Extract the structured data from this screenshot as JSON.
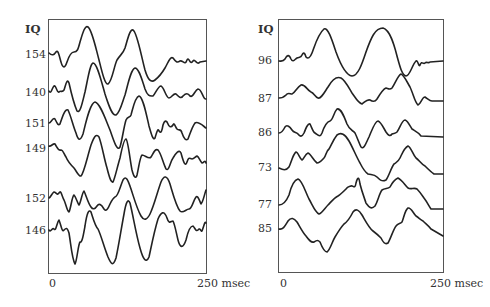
{
  "left_panel": {
    "header": "IQ",
    "labels": [
      "154",
      "140",
      "151",
      "149",
      "152",
      "146"
    ],
    "x_start": "0",
    "x_end": "250 msec"
  },
  "right_panel": {
    "header": "IQ",
    "labels": [
      "96",
      "87",
      "86",
      "73",
      "77",
      "85"
    ],
    "x_start": "0",
    "x_end": "250 msec"
  }
}
